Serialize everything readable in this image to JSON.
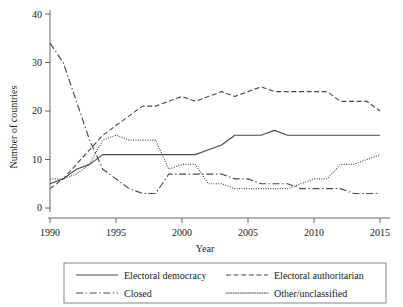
{
  "chart_data": {
    "type": "line",
    "title": "",
    "xlabel": "Year",
    "ylabel": "Number of countries",
    "xlim": [
      1990,
      2015
    ],
    "ylim": [
      0,
      40
    ],
    "xticks": [
      1990,
      1995,
      2000,
      2005,
      2010,
      2015
    ],
    "yticks": [
      0,
      10,
      20,
      30,
      40
    ],
    "grid": false,
    "legend_position": "below-axes",
    "x": [
      1990,
      1991,
      1992,
      1993,
      1994,
      1995,
      1996,
      1997,
      1998,
      1999,
      2000,
      2001,
      2002,
      2003,
      2004,
      2005,
      2006,
      2007,
      2008,
      2009,
      2010,
      2011,
      2012,
      2013,
      2014,
      2015
    ],
    "series": [
      {
        "name": "Electoral democracy",
        "style": "solid",
        "color": "#4a4a4a",
        "values": [
          5,
          6,
          8,
          9,
          11,
          11,
          11,
          11,
          11,
          11,
          11,
          11,
          12,
          13,
          15,
          15,
          15,
          16,
          15,
          15,
          15,
          15,
          15,
          15,
          15,
          15
        ]
      },
      {
        "name": "Electoral authoritarian",
        "style": "dashed",
        "color": "#4a4a4a",
        "values": [
          4,
          6,
          9,
          12,
          15,
          17,
          19,
          21,
          21,
          22,
          23,
          22,
          23,
          24,
          23,
          24,
          25,
          24,
          24,
          24,
          24,
          24,
          22,
          22,
          22,
          20
        ]
      },
      {
        "name": "Closed",
        "style": "dash-dot",
        "color": "#4a4a4a",
        "values": [
          34,
          30,
          22,
          14,
          8,
          6,
          4,
          3,
          3,
          7,
          7,
          7,
          7,
          7,
          6,
          6,
          5,
          5,
          5,
          4,
          4,
          4,
          4,
          3,
          3,
          3
        ]
      },
      {
        "name": "Other/unclassified",
        "style": "dotted",
        "color": "#8c8c8c",
        "values": [
          6,
          6,
          7,
          9,
          14,
          15,
          14,
          14,
          14,
          8,
          9,
          9,
          5,
          5,
          4,
          4,
          4,
          4,
          4,
          5,
          6,
          6,
          9,
          9,
          10,
          11
        ]
      }
    ]
  },
  "axes": {
    "ylabel": "Number of countries",
    "xlabel": "Year",
    "ytick_labels": [
      "0",
      "10",
      "20",
      "30",
      "40"
    ],
    "xtick_labels": [
      "1990",
      "1995",
      "2000",
      "2005",
      "2010",
      "2015"
    ]
  },
  "legend": {
    "entries": [
      {
        "label": "Electoral democracy",
        "style": "solid"
      },
      {
        "label": "Electoral authoritarian",
        "style": "dashed"
      },
      {
        "label": "Closed",
        "style": "dash-dot"
      },
      {
        "label": "Other/unclassified",
        "style": "dotted"
      }
    ]
  }
}
